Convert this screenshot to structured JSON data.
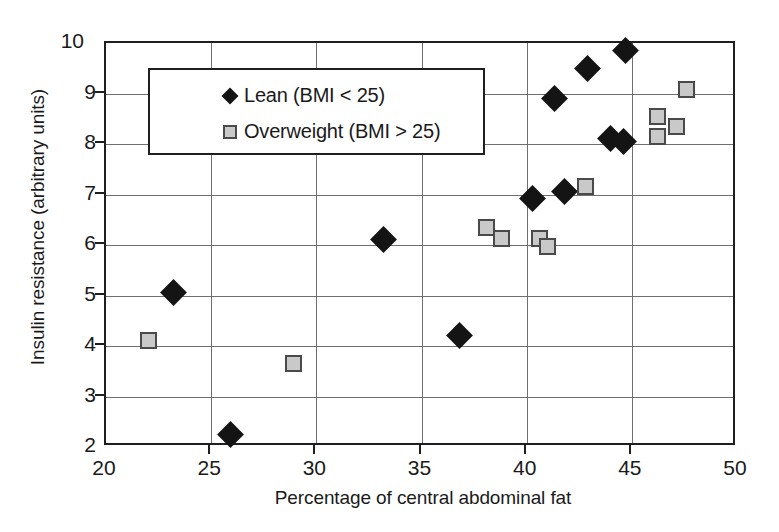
{
  "chart_data": {
    "type": "scatter",
    "title": "",
    "xlabel": "Percentage of central abdominal fat",
    "ylabel": "Insulin resistance (arbitrary units)",
    "xlim": [
      20,
      50
    ],
    "ylim": [
      2,
      10
    ],
    "xticks": [
      20,
      25,
      30,
      35,
      40,
      45,
      50
    ],
    "yticks": [
      2,
      3,
      4,
      5,
      6,
      7,
      8,
      9,
      10
    ],
    "grid": true,
    "legend_position": "upper-left-inside",
    "series": [
      {
        "name": "Lean (BMI < 25)",
        "marker": "diamond",
        "color": "#141414",
        "points": [
          [
            23.2,
            5.05
          ],
          [
            25.9,
            2.25
          ],
          [
            33.2,
            6.1
          ],
          [
            36.8,
            4.2
          ],
          [
            40.3,
            6.92
          ],
          [
            41.8,
            7.05
          ],
          [
            41.3,
            8.9
          ],
          [
            42.9,
            9.5
          ],
          [
            44.7,
            9.85
          ],
          [
            44.0,
            8.1
          ],
          [
            44.6,
            8.05
          ]
        ]
      },
      {
        "name": "Overweight (BMI > 25)",
        "marker": "square",
        "color": "#c9c9c9",
        "points": [
          [
            22.0,
            4.1
          ],
          [
            28.9,
            3.65
          ],
          [
            38.1,
            6.35
          ],
          [
            38.8,
            6.12
          ],
          [
            40.6,
            6.12
          ],
          [
            41.0,
            5.97
          ],
          [
            42.8,
            7.15
          ],
          [
            46.2,
            8.55
          ],
          [
            47.1,
            8.35
          ],
          [
            46.2,
            8.15
          ],
          [
            47.6,
            9.07
          ]
        ]
      }
    ]
  },
  "legend": {
    "items": [
      {
        "label": "Lean (BMI < 25)",
        "marker": "diamond"
      },
      {
        "label": "Overweight (BMI > 25)",
        "marker": "square"
      }
    ]
  },
  "axis": {
    "x_title": "Percentage of central abdominal fat",
    "y_title": "Insulin resistance (arbitrary units)",
    "x_tick_labels": [
      "20",
      "25",
      "30",
      "35",
      "40",
      "45",
      "50"
    ],
    "y_tick_labels": [
      "2",
      "3",
      "4",
      "5",
      "6",
      "7",
      "8",
      "9",
      "10"
    ]
  }
}
